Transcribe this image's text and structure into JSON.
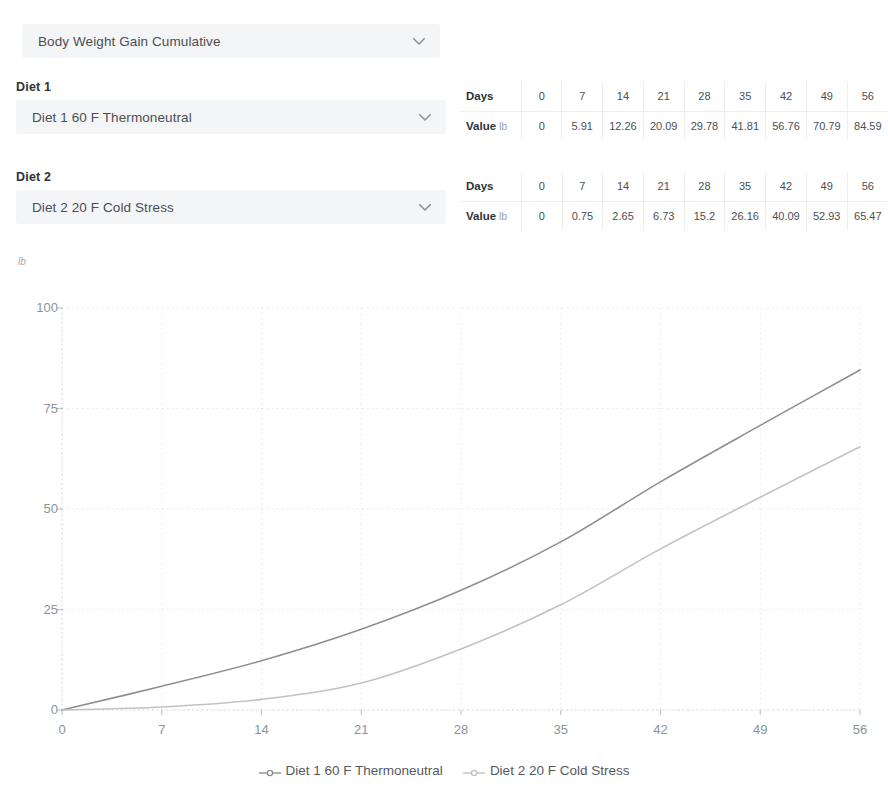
{
  "metric_select": {
    "value": "Body Weight Gain Cumulative",
    "icon": "chevron-down-icon"
  },
  "diet1": {
    "label": "Diet 1",
    "value": "Diet 1  60 F Thermoneutral",
    "table": {
      "row_days_label": "Days",
      "row_value_label": "Value",
      "row_value_unit": "lb",
      "days": [
        "0",
        "7",
        "14",
        "21",
        "28",
        "35",
        "42",
        "49",
        "56"
      ],
      "values": [
        "0",
        "5.91",
        "12.26",
        "20.09",
        "29.78",
        "41.81",
        "56.76",
        "70.79",
        "84.59"
      ]
    }
  },
  "diet2": {
    "label": "Diet 2",
    "value": "Diet 2  20 F Cold Stress",
    "table": {
      "row_days_label": "Days",
      "row_value_label": "Value",
      "row_value_unit": "lb",
      "days": [
        "0",
        "7",
        "14",
        "21",
        "28",
        "35",
        "42",
        "49",
        "56"
      ],
      "values": [
        "0",
        "0.75",
        "2.65",
        "6.73",
        "15.2",
        "26.16",
        "40.09",
        "52.93",
        "65.47"
      ]
    }
  },
  "chart_data": {
    "type": "line",
    "title": "",
    "xlabel": "",
    "ylabel": "lb",
    "y_unit": "lb",
    "x": [
      0,
      7,
      14,
      21,
      28,
      35,
      42,
      49,
      56
    ],
    "xlim": [
      0,
      56
    ],
    "ylim": [
      0,
      100
    ],
    "xticks": [
      0,
      7,
      14,
      21,
      28,
      35,
      42,
      49,
      56
    ],
    "yticks": [
      0,
      25,
      50,
      75,
      100
    ],
    "grid": true,
    "legend_position": "bottom",
    "series": [
      {
        "name": "Diet 1 60 F Thermoneutral",
        "color": "#8c8f94",
        "values": [
          0,
          5.91,
          12.26,
          20.09,
          29.78,
          41.81,
          56.76,
          70.79,
          84.59
        ]
      },
      {
        "name": "Diet 2 20 F Cold Stress",
        "color": "#bfc3c7",
        "values": [
          0,
          0.75,
          2.65,
          6.73,
          15.2,
          26.16,
          40.09,
          52.93,
          65.47
        ]
      }
    ]
  }
}
